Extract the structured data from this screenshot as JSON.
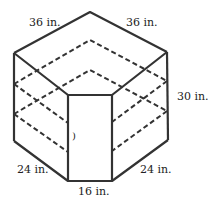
{
  "diagram": {
    "labels": {
      "top_left": "36 in.",
      "top_right": "36 in.",
      "height": "30 in.",
      "bottom_left": "24 in.",
      "bottom_right": "24 in.",
      "bottom_front": "16 in.",
      "inner_mark": ")"
    },
    "colors": {
      "stroke": "#333333",
      "background": "#ffffff"
    }
  }
}
